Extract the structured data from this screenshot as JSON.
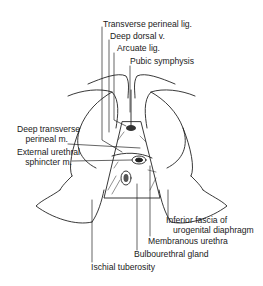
{
  "figure": {
    "type": "anatomical line drawing",
    "labels": {
      "transverse_perineal_lig": "Transverse perineal lig.",
      "deep_dorsal_v": "Deep dorsal v.",
      "arcuate_lig": "Arcuate lig.",
      "pubic_symphysis": "Pubic symphysis",
      "deep_transverse_perineal_line1": "Deep transverse",
      "deep_transverse_perineal_line2": "perineal m.",
      "external_urethral_line1": "External urethral",
      "external_urethral_line2": "sphincter m.",
      "inferior_fascia_line1": "Inferior fascia of",
      "inferior_fascia_line2": "urogenital diaphragm",
      "membranous_urethra": "Membranous urethra",
      "bulbourethral_gland": "Bulbourethral gland",
      "ischial_tuberosity": "Ischial tuberosity"
    }
  }
}
